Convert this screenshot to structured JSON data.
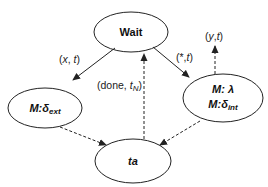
{
  "diagram": {
    "type": "state-transition",
    "colors": {
      "stroke": "#222222",
      "text": "#111111",
      "background": "#ffffff"
    },
    "nodes": [
      {
        "id": "wait",
        "label": "Wait"
      },
      {
        "id": "ext",
        "label_prefix": "M:",
        "label_symbol": "δ",
        "label_sub": "ext"
      },
      {
        "id": "int",
        "line1_prefix": "M: ",
        "line1_symbol": "λ",
        "line2_prefix": "M:",
        "line2_symbol": "δ",
        "line2_sub": "int"
      },
      {
        "id": "ta",
        "label": "ta"
      }
    ],
    "edges": [
      {
        "from": "wait",
        "to": "ext",
        "style": "solid",
        "label_open": "(",
        "label_var": "x",
        "label_sep": ", ",
        "label_t": "t",
        "label_close": ")"
      },
      {
        "from": "wait",
        "to": "int",
        "style": "solid",
        "label_open": "(*,",
        "label_t": "t",
        "label_close": ")"
      },
      {
        "from": "ta",
        "to": "wait",
        "style": "dashed",
        "label_open": "(done, ",
        "label_t": "t",
        "label_sub": "N",
        "label_close": ")"
      },
      {
        "from": "int",
        "to": "output",
        "style": "dashed",
        "label_open": "(",
        "label_var": "y",
        "label_sep": ",",
        "label_t": "t",
        "label_close": ")"
      },
      {
        "from": "ext",
        "to": "ta",
        "style": "dashed"
      },
      {
        "from": "int",
        "to": "ta",
        "style": "dashed"
      }
    ]
  }
}
